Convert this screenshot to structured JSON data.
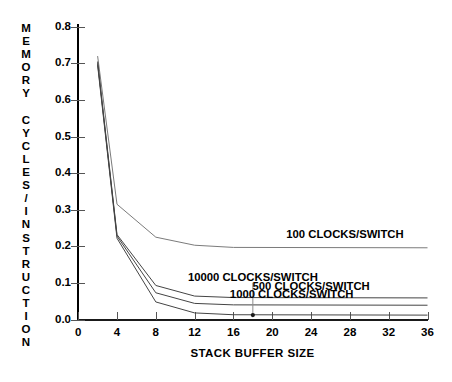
{
  "chart_data": {
    "type": "line",
    "title": "",
    "xlabel": "STACK BUFFER SIZE",
    "ylabel": "MEMORY CYCLES/INSTRUCTION",
    "xlim": [
      0,
      36
    ],
    "ylim": [
      0.0,
      0.8
    ],
    "xticks": [
      0,
      4,
      8,
      12,
      16,
      20,
      24,
      28,
      32,
      36
    ],
    "xtick_labels": [
      "0",
      "4",
      "8",
      "12",
      "16",
      "20",
      "24",
      "28",
      "32",
      "36"
    ],
    "yticks": [
      0.0,
      0.1,
      0.2,
      0.3,
      0.4,
      0.5,
      0.6,
      0.7,
      0.8
    ],
    "ytick_labels": [
      "0.0",
      "0.1",
      "0.2",
      "0.3",
      "0.4",
      "0.5",
      "0.6",
      "0.7",
      "0.8"
    ],
    "grid": false,
    "legend_position": "inline-annotations",
    "x": [
      2,
      4,
      8,
      12,
      16,
      36
    ],
    "series": [
      {
        "name": "100 CLOCKS/SWITCH",
        "label": "100 CLOCKS/SWITCH",
        "values": [
          0.72,
          0.315,
          0.225,
          0.203,
          0.197,
          0.196
        ]
      },
      {
        "name": "500 CLOCKS/SWITCH",
        "label": "500 CLOCKS/SWITCH",
        "values": [
          0.705,
          0.232,
          0.093,
          0.064,
          0.06,
          0.059
        ]
      },
      {
        "name": "1000 CLOCKS/SWITCH",
        "label": "1000 CLOCKS/SWITCH",
        "values": [
          0.7,
          0.228,
          0.073,
          0.044,
          0.04,
          0.039
        ]
      },
      {
        "name": "10000 CLOCKS/SWITCH",
        "label": "10000 CLOCKS/SWITCH",
        "values": [
          0.695,
          0.222,
          0.048,
          0.018,
          0.013,
          0.012
        ]
      }
    ],
    "annotations": [
      {
        "text": "100 CLOCKS/SWITCH",
        "x": 27.5,
        "y": 0.215
      },
      {
        "text": "10000 CLOCKS/SWITCH",
        "x": 18.0,
        "y": 0.098,
        "leader_to_point": {
          "x": 18,
          "y": 0.012
        }
      },
      {
        "text": "500 CLOCKS/SWITCH",
        "x": 24.0,
        "y": 0.072
      },
      {
        "text": "1000 CLOCKS/SWITCH",
        "x": 22.0,
        "y": 0.052
      }
    ]
  },
  "axis": {
    "ylabel_letters": [
      "M",
      "E",
      "M",
      "O",
      "R",
      "Y",
      " ",
      "C",
      "Y",
      "C",
      "L",
      "E",
      "S",
      "/",
      "I",
      "N",
      "S",
      "T",
      "R",
      "U",
      "C",
      "T",
      "I",
      "O",
      "N"
    ]
  }
}
